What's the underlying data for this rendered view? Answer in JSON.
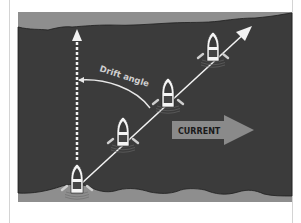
{
  "diagram": {
    "labels": {
      "drift_angle": "Drift angle",
      "current": "CURRENT"
    },
    "colors": {
      "water": "#3b3b3b",
      "bank": "#8e8e8e",
      "shoreline": "#1e1e1e",
      "arrow": "#f2f2f2",
      "current_arrow": "#8a8a8a",
      "current_text": "#1a1a1a",
      "boat_hull": "#f5f5f5",
      "boat_cabin": "#444444"
    },
    "boats": [
      {
        "x": 77,
        "y": 180
      },
      {
        "x": 123,
        "y": 133
      },
      {
        "x": 168,
        "y": 94
      },
      {
        "x": 213,
        "y": 48
      }
    ],
    "elements": {
      "heading_arrow": "intended heading (dotted vertical)",
      "track_arrow": "actual track over ground (diagonal)",
      "drift_arc": "angle between heading and track"
    }
  }
}
